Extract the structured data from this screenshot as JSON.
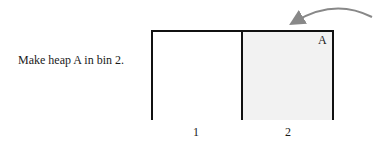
{
  "instruction": "Make heap A in bin 2.",
  "heap": {
    "label": "A",
    "bin": 2
  },
  "bins": [
    {
      "label": "1",
      "highlighted": false
    },
    {
      "label": "2",
      "highlighted": true
    }
  ],
  "colors": {
    "line": "#111111",
    "highlight": "#f2f2f2",
    "arrow": "#888888"
  },
  "arrow": {
    "direction": "incoming-from-right",
    "target_bin": 2
  }
}
